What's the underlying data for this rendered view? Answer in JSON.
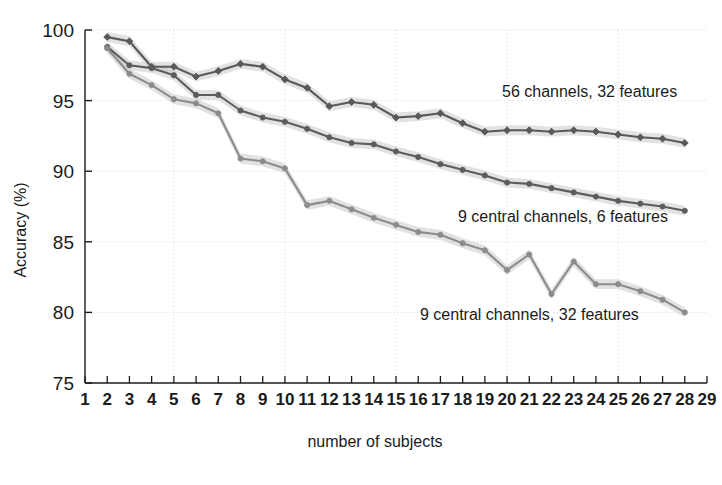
{
  "chart_data": {
    "type": "line",
    "title": "",
    "xlabel": "number of subjects",
    "ylabel": "Accuracy (%)",
    "xlim": [
      1,
      29
    ],
    "ylim": [
      75,
      100
    ],
    "yticks": [
      75,
      80,
      85,
      90,
      95,
      100
    ],
    "xticks": [
      1,
      2,
      3,
      4,
      5,
      6,
      7,
      8,
      9,
      10,
      11,
      12,
      13,
      14,
      15,
      16,
      17,
      18,
      19,
      20,
      21,
      22,
      23,
      24,
      25,
      26,
      27,
      28,
      29
    ],
    "xticklabels": [
      "1",
      "2",
      "3",
      "4",
      "5",
      "6",
      "7",
      "8",
      "9",
      "10",
      "11",
      "12",
      "13",
      "14",
      "15",
      "16",
      "17",
      "18",
      "19",
      "20",
      "21",
      "22",
      "23",
      "24",
      "25",
      "26",
      "27",
      "28",
      "29"
    ],
    "grid": true,
    "legend_position": "inline-annotations",
    "x": [
      2,
      3,
      4,
      5,
      6,
      7,
      8,
      9,
      10,
      11,
      12,
      13,
      14,
      15,
      16,
      17,
      18,
      19,
      20,
      21,
      22,
      23,
      24,
      25,
      26,
      27,
      28
    ],
    "series": [
      {
        "name": "56 channels, 32 features",
        "color": "#595959",
        "marker": "diamond",
        "shaded_band": true,
        "values": [
          99.5,
          99.2,
          97.4,
          97.4,
          96.7,
          97.1,
          97.6,
          97.4,
          96.5,
          95.9,
          94.6,
          94.9,
          94.7,
          93.8,
          93.9,
          94.1,
          93.4,
          92.8,
          92.9,
          92.9,
          92.8,
          92.9,
          92.8,
          92.6,
          92.4,
          92.3,
          92.0
        ]
      },
      {
        "name": "9 central channels, 6 features",
        "color": "#5c5c5c",
        "marker": "circle",
        "shaded_band": true,
        "values": [
          98.8,
          97.5,
          97.3,
          96.8,
          95.4,
          95.4,
          94.3,
          93.8,
          93.5,
          93.0,
          92.4,
          92.0,
          91.9,
          91.4,
          91.0,
          90.5,
          90.1,
          89.7,
          89.2,
          89.1,
          88.8,
          88.5,
          88.2,
          87.9,
          87.7,
          87.5,
          87.2
        ]
      },
      {
        "name": "9 central channels, 32 features",
        "color": "#8c8c8c",
        "marker": "circle",
        "shaded_band": true,
        "values": [
          98.7,
          96.9,
          96.1,
          95.1,
          94.8,
          94.1,
          90.9,
          90.7,
          90.2,
          87.6,
          87.9,
          87.3,
          86.7,
          86.2,
          85.7,
          85.5,
          84.9,
          84.4,
          83.0,
          84.1,
          81.3,
          83.6,
          82.0,
          82.0,
          81.5,
          80.9,
          80.0
        ]
      }
    ],
    "annotations": [
      {
        "text": "56 channels, 32 features",
        "x_px": 502,
        "y_px": 97
      },
      {
        "text": "9 central channels, 6 features",
        "x_px": 458,
        "y_px": 222
      },
      {
        "text": "9 central channels, 32 features",
        "x_px": 420,
        "y_px": 320
      }
    ]
  },
  "axes": {
    "ylabel": "Accuracy (%)",
    "xlabel": "number of subjects"
  }
}
